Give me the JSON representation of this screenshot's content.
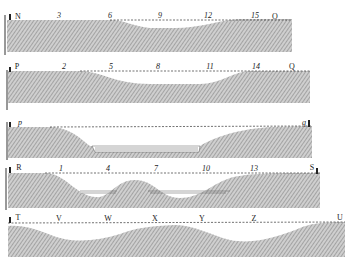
{
  "figure": {
    "colors": {
      "ink": "#222222",
      "hatch": "#7a7a7a",
      "fill": "#c8c8c8",
      "background": "#ffffff"
    },
    "sections": [
      {
        "id": "N-O",
        "start_label": "N",
        "end_label": "O",
        "stations": [
          "3",
          "6",
          "9",
          "12",
          "15"
        ]
      },
      {
        "id": "P-Q",
        "start_label": "P",
        "end_label": "Q",
        "stations": [
          "2",
          "5",
          "8",
          "11",
          "14"
        ]
      },
      {
        "id": "p-q",
        "start_label": "p",
        "end_label": "q",
        "stations": [
          "",
          "",
          "",
          ""
        ]
      },
      {
        "id": "R-S",
        "start_label": "R",
        "end_label": "S",
        "stations": [
          "1",
          "4",
          "7",
          "10",
          "13"
        ]
      },
      {
        "id": "T-U",
        "start_label": "T",
        "end_label": "U",
        "stations": [
          "V",
          "W",
          "X",
          "Y",
          "Z",
          ""
        ]
      }
    ]
  }
}
